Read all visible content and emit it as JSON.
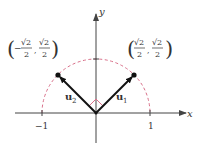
{
  "figure": {
    "axes": {
      "x_label": "x",
      "y_label": "y",
      "x_ticks": [
        {
          "value": -1,
          "label": "−1"
        },
        {
          "value": 1,
          "label": "1"
        }
      ]
    },
    "circle": {
      "style": "dashed",
      "color": "#d9708a",
      "radius": 1,
      "portion": "upper semicircle"
    },
    "vectors": [
      {
        "name": "u1",
        "label_base": "u",
        "label_sub": "1",
        "tip": "(√2/2, √2/2)"
      },
      {
        "name": "u2",
        "label_base": "u",
        "label_sub": "2",
        "tip": "(−√2/2, √2/2)"
      }
    ],
    "points": {
      "left": {
        "sign": "−",
        "num": "√2",
        "den": "2",
        "num2": "√2",
        "den2": "2"
      },
      "right": {
        "sign": "",
        "num": "√2",
        "den": "2",
        "num2": "√2",
        "den2": "2"
      }
    },
    "right_angle_marker_color": "#d9708a",
    "colors": {
      "axis": "#444444",
      "vector": "#111111",
      "circle": "#d9708a"
    }
  }
}
